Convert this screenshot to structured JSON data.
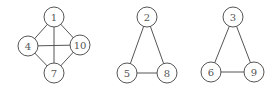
{
  "graphs": [
    {
      "name": "graph-a",
      "nodes": [
        {
          "id": "1",
          "label": "1",
          "x": 54,
          "y": 17
        },
        {
          "id": "4",
          "label": "4",
          "x": 28,
          "y": 46
        },
        {
          "id": "10",
          "label": "10",
          "x": 80,
          "y": 45
        },
        {
          "id": "7",
          "label": "7",
          "x": 54,
          "y": 73
        }
      ],
      "edges": [
        [
          "1",
          "4"
        ],
        [
          "1",
          "10"
        ],
        [
          "1",
          "7"
        ],
        [
          "4",
          "10"
        ],
        [
          "4",
          "7"
        ],
        [
          "10",
          "7"
        ]
      ]
    },
    {
      "name": "graph-b",
      "nodes": [
        {
          "id": "2",
          "label": "2",
          "x": 147,
          "y": 17
        },
        {
          "id": "5",
          "label": "5",
          "x": 127,
          "y": 73
        },
        {
          "id": "8",
          "label": "8",
          "x": 167,
          "y": 73
        }
      ],
      "edges": [
        [
          "2",
          "5"
        ],
        [
          "2",
          "8"
        ],
        [
          "5",
          "8"
        ]
      ]
    },
    {
      "name": "graph-c",
      "nodes": [
        {
          "id": "3",
          "label": "3",
          "x": 233,
          "y": 17
        },
        {
          "id": "6",
          "label": "6",
          "x": 211,
          "y": 72
        },
        {
          "id": "9",
          "label": "9",
          "x": 254,
          "y": 72
        }
      ],
      "edges": [
        [
          "3",
          "6"
        ],
        [
          "3",
          "9"
        ],
        [
          "6",
          "9"
        ]
      ]
    }
  ],
  "style": {
    "node_radius": 10,
    "stroke": "#555555"
  }
}
